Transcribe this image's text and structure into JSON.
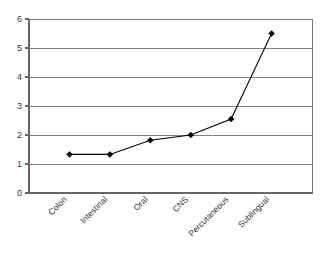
{
  "chart_data": {
    "type": "line",
    "title": "",
    "subtitle": "",
    "xlabel": "",
    "ylabel": "",
    "categories": [
      "Colon",
      "Intestinal",
      "Oral",
      "CNS",
      "Percutaneous",
      "Sublingual"
    ],
    "values": [
      1.33,
      1.33,
      1.82,
      2.0,
      2.55,
      5.5
    ],
    "series": [
      {
        "name": "",
        "values": [
          1.33,
          1.33,
          1.82,
          2.0,
          2.55,
          5.5
        ]
      }
    ],
    "ylim": [
      0,
      6
    ],
    "ytick_labels": [
      "0",
      "1",
      "2",
      "3",
      "4",
      "5",
      "6"
    ],
    "ytick_values": [
      0,
      1,
      2,
      3,
      4,
      5,
      6
    ],
    "grid": true,
    "grid_axis": "y",
    "legend": false,
    "legend_position": "none",
    "marker": "diamond",
    "xtick_rotation": 45,
    "colors": {
      "line": "#000000",
      "marker": "#000000",
      "grid": "#808080",
      "axis": "#666666",
      "background": "#ffffff",
      "text": "#333333"
    }
  },
  "axes": {
    "y_ticks": [
      {
        "label": "6",
        "value": 6
      },
      {
        "label": "5",
        "value": 5
      },
      {
        "label": "4",
        "value": 4
      },
      {
        "label": "3",
        "value": 3
      },
      {
        "label": "2",
        "value": 2
      },
      {
        "label": "1",
        "value": 1
      },
      {
        "label": "0",
        "value": 0
      }
    ],
    "x_ticks": [
      {
        "label": "Colon",
        "value": 1.33
      },
      {
        "label": "Intestinal",
        "value": 1.33
      },
      {
        "label": "Oral",
        "value": 1.82
      },
      {
        "label": "CNS",
        "value": 2.0
      },
      {
        "label": "Percutaneous",
        "value": 2.55
      },
      {
        "label": "Sublingual",
        "value": 5.5
      }
    ]
  }
}
